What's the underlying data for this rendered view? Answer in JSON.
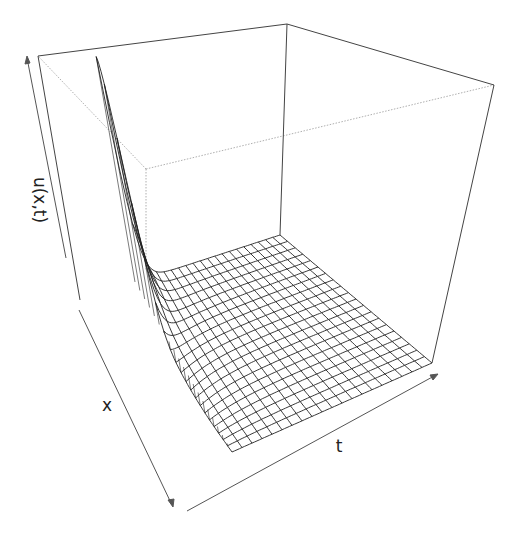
{
  "chart_data": {
    "type": "surface",
    "title": "",
    "xlabel": "x",
    "ylabel": "t",
    "zlabel": "u(x,t)",
    "grid": {
      "nx": 20,
      "nt": 20
    },
    "peak": {
      "x_fraction": 0.0,
      "t_fraction": 0.0,
      "u_fraction": 0.92
    },
    "ticks": "none",
    "box": true,
    "colors": {
      "line": "#222222",
      "box": "#444444",
      "hidden": "#999999"
    }
  },
  "labels": {
    "z": "u(x,t)",
    "x": "x",
    "t": "t"
  }
}
